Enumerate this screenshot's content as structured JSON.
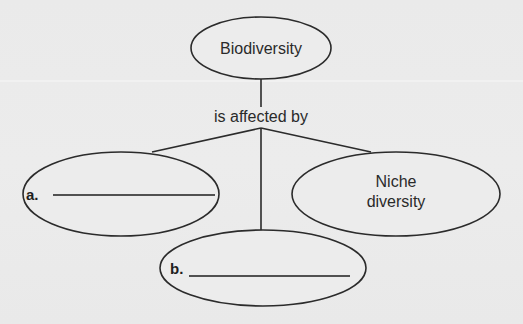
{
  "diagram": {
    "type": "concept-map",
    "root": {
      "label": "Biodiversity"
    },
    "connector": {
      "label": "is affected by"
    },
    "children": [
      {
        "id": "a",
        "marker": "a.",
        "label": "",
        "blank": true
      },
      {
        "id": "niche",
        "label_line1": "Niche",
        "label_line2": "diversity",
        "blank": false
      },
      {
        "id": "b",
        "marker": "b.",
        "label": "",
        "blank": true
      }
    ]
  },
  "colors": {
    "background": "#ebebeb",
    "stroke": "#2b2b2b",
    "text": "#2a2a2a"
  }
}
